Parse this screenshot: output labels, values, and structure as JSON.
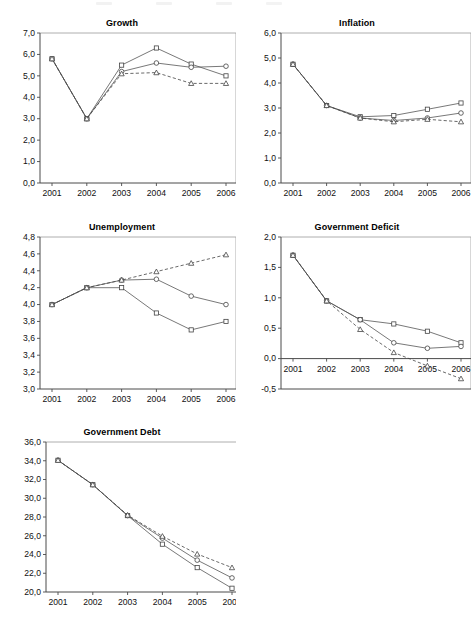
{
  "figure": {
    "decimal_separator": ",",
    "series_names": [
      "square-series",
      "circle-series",
      "triangle-series"
    ],
    "categories": [
      "2001",
      "2002",
      "2003",
      "2004",
      "2005",
      "2006"
    ]
  },
  "chart_data": [
    {
      "type": "line",
      "title": "Growth",
      "xlabel": "",
      "ylabel": "",
      "categories": [
        "2001",
        "2002",
        "2003",
        "2004",
        "2005",
        "2006"
      ],
      "ylim": [
        0.0,
        7.0
      ],
      "yticks": [
        "0,0",
        "1,0",
        "2,0",
        "3,0",
        "4,0",
        "5,0",
        "6,0",
        "7,0"
      ],
      "grid": false,
      "legend": "none",
      "series": [
        {
          "name": "square-series",
          "marker": "square",
          "style": "solid",
          "values": [
            5.8,
            3.0,
            5.5,
            6.3,
            5.55,
            5.0
          ]
        },
        {
          "name": "circle-series",
          "marker": "circle",
          "style": "solid",
          "values": [
            5.8,
            3.0,
            5.2,
            5.6,
            5.4,
            5.45
          ]
        },
        {
          "name": "triangle-series",
          "marker": "triangle",
          "style": "dashed",
          "values": [
            5.8,
            3.0,
            5.1,
            5.15,
            4.65,
            4.65
          ]
        }
      ]
    },
    {
      "type": "line",
      "title": "Inflation",
      "xlabel": "",
      "ylabel": "",
      "categories": [
        "2001",
        "2002",
        "2003",
        "2004",
        "2005",
        "2006"
      ],
      "ylim": [
        0.0,
        6.0
      ],
      "yticks": [
        "0,0",
        "1,0",
        "2,0",
        "3,0",
        "4,0",
        "5,0",
        "6,0"
      ],
      "grid": false,
      "legend": "none",
      "series": [
        {
          "name": "square-series",
          "marker": "square",
          "style": "solid",
          "values": [
            4.75,
            3.1,
            2.65,
            2.7,
            2.95,
            3.2
          ]
        },
        {
          "name": "circle-series",
          "marker": "circle",
          "style": "solid",
          "values": [
            4.75,
            3.1,
            2.6,
            2.5,
            2.6,
            2.8
          ]
        },
        {
          "name": "triangle-series",
          "marker": "triangle",
          "style": "dashed",
          "values": [
            4.75,
            3.1,
            2.6,
            2.45,
            2.55,
            2.45
          ]
        }
      ]
    },
    {
      "type": "line",
      "title": "Unemployment",
      "xlabel": "",
      "ylabel": "",
      "categories": [
        "2001",
        "2002",
        "2003",
        "2004",
        "2005",
        "2006"
      ],
      "ylim": [
        3.0,
        4.8
      ],
      "yticks": [
        "3,0",
        "3,2",
        "3,4",
        "3,6",
        "3,8",
        "4,0",
        "4,2",
        "4,4",
        "4,6",
        "4,8"
      ],
      "grid": false,
      "legend": "none",
      "series": [
        {
          "name": "square-series",
          "marker": "square",
          "style": "solid",
          "values": [
            4.0,
            4.2,
            4.2,
            3.9,
            3.7,
            3.8
          ]
        },
        {
          "name": "circle-series",
          "marker": "circle",
          "style": "solid",
          "values": [
            4.0,
            4.2,
            4.29,
            4.3,
            4.1,
            4.0
          ]
        },
        {
          "name": "triangle-series",
          "marker": "triangle",
          "style": "dashed",
          "values": [
            4.0,
            4.2,
            4.29,
            4.39,
            4.49,
            4.59
          ]
        }
      ]
    },
    {
      "type": "line",
      "title": "Government Deficit",
      "xlabel": "",
      "ylabel": "",
      "categories": [
        "2001",
        "2002",
        "2003",
        "2004",
        "2005",
        "2006"
      ],
      "ylim": [
        -0.5,
        2.0
      ],
      "yticks": [
        "-0,5",
        "0,0",
        "0,5",
        "1,0",
        "1,5",
        "2,0"
      ],
      "grid": false,
      "legend": "none",
      "series": [
        {
          "name": "square-series",
          "marker": "square",
          "style": "solid",
          "values": [
            1.7,
            0.95,
            0.64,
            0.57,
            0.45,
            0.26
          ]
        },
        {
          "name": "circle-series",
          "marker": "circle",
          "style": "solid",
          "values": [
            1.7,
            0.95,
            0.64,
            0.26,
            0.17,
            0.2
          ]
        },
        {
          "name": "triangle-series",
          "marker": "triangle",
          "style": "dashed",
          "values": [
            1.7,
            0.95,
            0.48,
            0.1,
            -0.12,
            -0.33
          ]
        }
      ]
    },
    {
      "type": "line",
      "title": "Government Debt",
      "xlabel": "",
      "ylabel": "",
      "categories": [
        "2001",
        "2002",
        "2003",
        "2004",
        "2005",
        "2006"
      ],
      "ylim": [
        20.0,
        36.0
      ],
      "yticks": [
        "20,0",
        "22,0",
        "24,0",
        "26,0",
        "28,0",
        "30,0",
        "32,0",
        "34,0",
        "36,0"
      ],
      "grid": false,
      "legend": "none",
      "series": [
        {
          "name": "square-series",
          "marker": "square",
          "style": "solid",
          "values": [
            34.05,
            31.45,
            28.15,
            25.1,
            22.6,
            20.4
          ]
        },
        {
          "name": "circle-series",
          "marker": "circle",
          "style": "solid",
          "values": [
            34.05,
            31.45,
            28.15,
            25.75,
            23.4,
            21.5
          ]
        },
        {
          "name": "triangle-series",
          "marker": "triangle",
          "style": "dashed",
          "values": [
            34.05,
            31.45,
            28.2,
            25.95,
            24.05,
            22.6
          ]
        }
      ]
    }
  ]
}
